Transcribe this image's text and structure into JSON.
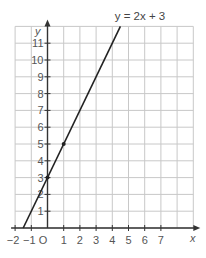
{
  "chart_data": {
    "type": "line",
    "title": "y = 2x + 3",
    "xlabel": "x",
    "ylabel": "y",
    "origin_label": "O",
    "xlim": [
      -2,
      9
    ],
    "ylim": [
      0,
      12
    ],
    "x_ticks": [
      -2,
      -1,
      1,
      2,
      3,
      4,
      5,
      6,
      7
    ],
    "y_ticks": [
      1,
      2,
      3,
      4,
      5,
      6,
      7,
      8,
      9,
      10,
      11
    ],
    "grid": true,
    "series": [
      {
        "name": "y = 2x + 3",
        "x": [
          -1.5,
          4.5
        ],
        "y": [
          0,
          12
        ],
        "color": "#222222"
      }
    ],
    "marked_points": [
      {
        "x": 0,
        "y": 3
      },
      {
        "x": 1,
        "y": 5
      }
    ],
    "colors": {
      "grid": "#c8c8c8",
      "axis": "#333333",
      "line": "#222222",
      "text": "#555555"
    }
  }
}
